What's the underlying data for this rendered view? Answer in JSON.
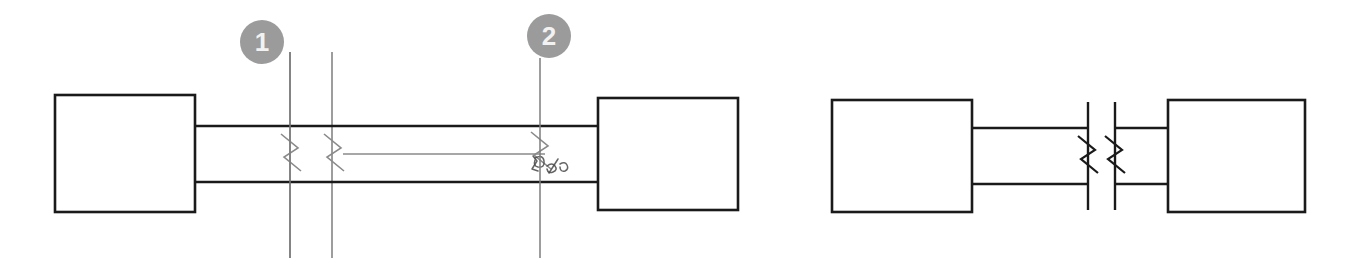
{
  "drawing": {
    "title": "Shaft coupling assembly detail with break symbols",
    "background_color": "#ffffff",
    "line_color": "#1a1a1a",
    "thin_line_color": "#8a8a8a",
    "extension_line_color": "#7c7c7c",
    "balloon_fill_color": "#9b9b9b",
    "balloon_text_color": "#f2f2f2",
    "annotation_color": "#4a4a4a",
    "callouts": [
      {
        "label": "1",
        "name": "balloon-callout-1",
        "cx": 262,
        "cy": 42,
        "r": 22,
        "leader_x": 290,
        "leader_y1": 52,
        "leader_y2": 258
      },
      {
        "label": "2",
        "name": "balloon-callout-2",
        "cx": 549,
        "cy": 36,
        "r": 22,
        "leader_x": 540,
        "leader_y1": 58,
        "leader_y2": 258
      }
    ],
    "left_assembly": {
      "name": "left-assembly",
      "left_block": {
        "x": 55,
        "y": 95,
        "w": 140,
        "h": 117
      },
      "right_block": {
        "x": 598,
        "y": 98,
        "w": 140,
        "h": 112
      },
      "shaft_top_y": 126,
      "shaft_bottom_y": 182,
      "shaft_x1": 195,
      "shaft_x2": 598,
      "inner_line": {
        "x1": 343,
        "x2": 545,
        "y": 154
      },
      "extension_lines": [
        {
          "x": 290,
          "y1": 52,
          "y2": 258
        },
        {
          "x": 332,
          "y1": 52,
          "y2": 258
        }
      ],
      "break_symbols": [
        {
          "name": "break-symbol-a",
          "x": 291,
          "y": 154
        },
        {
          "name": "break-symbol-b",
          "x": 334,
          "y": 154
        },
        {
          "name": "break-symbol-c",
          "x": 541,
          "y": 152
        }
      ],
      "handwritten_note": {
        "x": 533,
        "y": 168,
        "text": "handwritten-pen-mark"
      }
    },
    "right_assembly": {
      "name": "right-assembly",
      "left_block": {
        "x": 832,
        "y": 100,
        "w": 140,
        "h": 112
      },
      "right_block": {
        "x": 1168,
        "y": 100,
        "w": 137,
        "h": 112
      },
      "shaft_top_y": 128,
      "shaft_bottom_y": 184,
      "left_shaft_x1": 972,
      "left_shaft_x2": 1088,
      "right_shaft_x1": 1115,
      "right_shaft_x2": 1168,
      "break_lines": [
        {
          "name": "break-line-left",
          "x": 1088,
          "y1": 102,
          "y2": 210
        },
        {
          "name": "break-line-right",
          "x": 1115,
          "y1": 102,
          "y2": 210
        }
      ],
      "break_symbols": [
        {
          "name": "break-symbol-d",
          "x": 1088,
          "y": 156
        },
        {
          "name": "break-symbol-e",
          "x": 1115,
          "y": 156
        }
      ]
    }
  }
}
